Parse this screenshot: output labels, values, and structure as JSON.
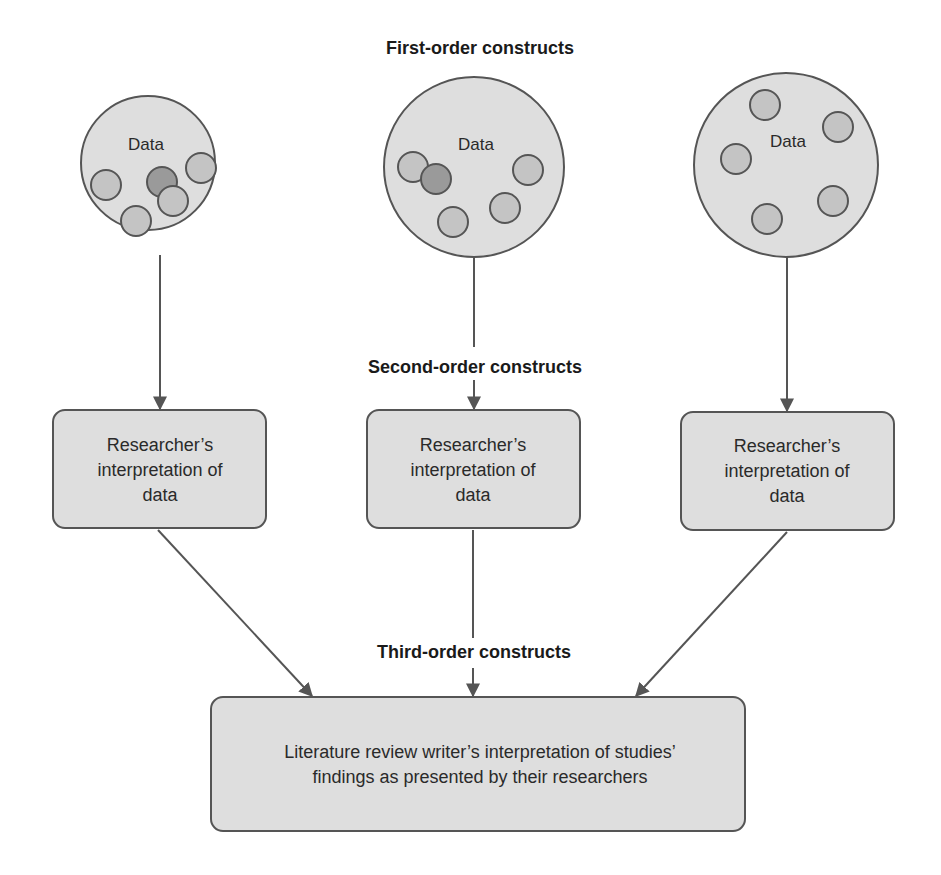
{
  "labels": {
    "first_order": "First-order constructs",
    "second_order": "Second-order constructs",
    "third_order": "Third-order constructs"
  },
  "data_groups": [
    {
      "label": "Data",
      "center": [
        148,
        163
      ],
      "r": 67,
      "dots": [
        {
          "x": 106,
          "y": 185,
          "r": 15,
          "shade": "light"
        },
        {
          "x": 162,
          "y": 182,
          "r": 15,
          "shade": "dark"
        },
        {
          "x": 201,
          "y": 168,
          "r": 15,
          "shade": "light"
        },
        {
          "x": 173,
          "y": 201,
          "r": 15,
          "shade": "light"
        },
        {
          "x": 136,
          "y": 221,
          "r": 15,
          "shade": "light"
        }
      ]
    },
    {
      "label": "Data",
      "center": [
        474,
        167
      ],
      "r": 90,
      "dots": [
        {
          "x": 413,
          "y": 167,
          "r": 15,
          "shade": "light"
        },
        {
          "x": 436,
          "y": 179,
          "r": 15,
          "shade": "dark"
        },
        {
          "x": 528,
          "y": 170,
          "r": 15,
          "shade": "light"
        },
        {
          "x": 505,
          "y": 208,
          "r": 15,
          "shade": "light"
        },
        {
          "x": 453,
          "y": 222,
          "r": 15,
          "shade": "light"
        }
      ]
    },
    {
      "label": "Data",
      "center": [
        786,
        165
      ],
      "r": 92,
      "dots": [
        {
          "x": 765,
          "y": 105,
          "r": 15,
          "shade": "light"
        },
        {
          "x": 838,
          "y": 127,
          "r": 15,
          "shade": "light"
        },
        {
          "x": 736,
          "y": 159,
          "r": 15,
          "shade": "light"
        },
        {
          "x": 833,
          "y": 201,
          "r": 15,
          "shade": "light"
        },
        {
          "x": 767,
          "y": 219,
          "r": 15,
          "shade": "light"
        }
      ]
    }
  ],
  "researcher_boxes": [
    {
      "lines": [
        "Researcher’s",
        "interpretation of",
        "data"
      ]
    },
    {
      "lines": [
        "Researcher’s",
        "interpretation of",
        "data"
      ]
    },
    {
      "lines": [
        "Researcher’s",
        "interpretation of",
        "data"
      ]
    }
  ],
  "literature_box": {
    "lines": [
      "Literature review writer’s interpretation of studies’",
      "findings as presented by their researchers"
    ]
  },
  "colors": {
    "fill": "#dedede",
    "stroke": "#555555",
    "dot_light": "#c4c4c4",
    "dot_dark": "#9a9a9a",
    "arrow": "#555555"
  }
}
